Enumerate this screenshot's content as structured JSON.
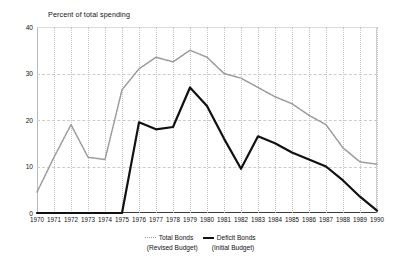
{
  "chart_data": {
    "type": "line",
    "title": "Percent of total spending",
    "xlabel": "",
    "ylabel": "",
    "ylim": [
      0,
      40
    ],
    "yticks": [
      0,
      10,
      20,
      30,
      40
    ],
    "grid": true,
    "legend_position": "bottom-center",
    "categories": [
      "1970",
      "1971",
      "1972",
      "1973",
      "1974",
      "1975",
      "1976",
      "1977",
      "1978",
      "1979",
      "1980",
      "1981",
      "1982",
      "1983",
      "1984",
      "1985",
      "1986",
      "1987",
      "1988",
      "1989",
      "1990"
    ],
    "series": [
      {
        "name": "Total Bonds",
        "sublabel": "(Revised Budget)",
        "color": "#9a9a9a",
        "style": "dotted",
        "values": [
          4.5,
          12.0,
          19.0,
          12.0,
          11.5,
          26.5,
          31.0,
          33.5,
          32.5,
          35.0,
          33.5,
          30.0,
          29.0,
          27.0,
          25.0,
          23.5,
          21.0,
          19.0,
          14.0,
          11.0,
          10.5
        ]
      },
      {
        "name": "Deficit Bonds",
        "sublabel": "(Initial Budget)",
        "color": "#111111",
        "style": "solid",
        "values": [
          0.0,
          0.0,
          0.0,
          0.0,
          0.0,
          0.0,
          19.5,
          18.0,
          18.5,
          27.0,
          23.0,
          16.0,
          9.5,
          16.5,
          15.0,
          13.0,
          11.5,
          10.0,
          7.0,
          3.5,
          0.5
        ]
      }
    ]
  },
  "legend": {
    "series_1_label": "Total Bonds",
    "series_1_sublabel": "(Revised Budget)",
    "series_2_label": "Deficit Bonds",
    "series_2_sublabel": "(Initial Budget)"
  }
}
